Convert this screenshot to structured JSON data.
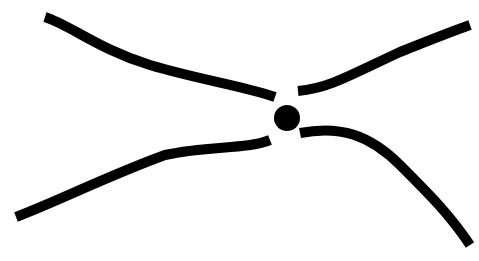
{
  "diagram": {
    "width": 479,
    "height": 261,
    "background": "#ffffff",
    "stroke_color": "#000000",
    "stroke_width": 10,
    "curves": [
      {
        "name": "upper-left-curve",
        "d": "M 45 17 C 70 25, 100 50, 150 65 C 200 80, 240 85, 275 97"
      },
      {
        "name": "upper-right-curve",
        "d": "M 298 91 C 330 88, 350 75, 400 52 C 430 40, 450 32, 470 25"
      },
      {
        "name": "lower-left-curve",
        "d": "M 16 217 C 60 200, 110 175, 165 155 C 210 145, 245 150, 270 140"
      },
      {
        "name": "lower-right-curve",
        "d": "M 300 133 C 340 125, 370 135, 400 165 C 430 195, 450 215, 470 245"
      }
    ],
    "node": {
      "name": "center-node",
      "cx": 287,
      "cy": 118,
      "r": 13
    }
  }
}
